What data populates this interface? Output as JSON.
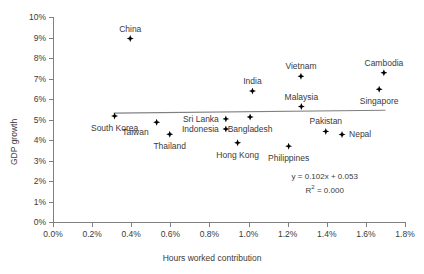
{
  "chart_data": {
    "type": "scatter",
    "title": "",
    "xlabel": "Hours worked contribution",
    "ylabel": "GDP growth",
    "xlim": [
      0.0,
      1.8
    ],
    "ylim": [
      0.0,
      10.0
    ],
    "xticks": [
      "0.0%",
      "0.2%",
      "0.4%",
      "0.6%",
      "0.8%",
      "1.0%",
      "1.2%",
      "1.4%",
      "1.6%",
      "1.8%"
    ],
    "xtick_values": [
      0.0,
      0.2,
      0.4,
      0.6,
      0.8,
      1.0,
      1.2,
      1.4,
      1.6,
      1.8
    ],
    "yticks": [
      "0%",
      "1%",
      "2%",
      "3%",
      "4%",
      "5%",
      "6%",
      "7%",
      "8%",
      "9%",
      "10%"
    ],
    "ytick_values": [
      0,
      1,
      2,
      3,
      4,
      5,
      6,
      7,
      8,
      9,
      10
    ],
    "grid": false,
    "legend": "none",
    "marker_color": "#000000",
    "axis_color": "#808080",
    "text_color": "#3a3a3a",
    "trendline": {
      "equation": "y = 0.102x + 0.053",
      "r_squared_label": "R",
      "r_squared_sup": "2",
      "r_squared_value": "= 0.000",
      "x_start": 0.31,
      "x_end": 1.7,
      "y_start": 5.31,
      "y_end": 5.45,
      "color": "#808080"
    },
    "points": [
      {
        "name": "China",
        "x": 0.395,
        "y": 8.95,
        "label_dx": 0,
        "label_dy": -9,
        "anchor": "center"
      },
      {
        "name": "South Korea",
        "x": 0.315,
        "y": 5.17,
        "label_dx": 0,
        "label_dy": 13,
        "anchor": "center"
      },
      {
        "name": "Taiwan",
        "x": 0.53,
        "y": 4.87,
        "label_dx": -8,
        "label_dy": 11,
        "anchor": "right"
      },
      {
        "name": "Thailand",
        "x": 0.597,
        "y": 4.28,
        "label_dx": 0,
        "label_dy": 13,
        "anchor": "center"
      },
      {
        "name": "Sri Lanka",
        "x": 0.884,
        "y": 5.03,
        "label_dx": -7,
        "label_dy": 1,
        "anchor": "right"
      },
      {
        "name": "Indonesia",
        "x": 0.884,
        "y": 4.54,
        "label_dx": -7,
        "label_dy": 1,
        "anchor": "right"
      },
      {
        "name": "Bangladesh",
        "x": 1.008,
        "y": 5.12,
        "label_dx": 0,
        "label_dy": 13,
        "anchor": "center"
      },
      {
        "name": "Hong Kong",
        "x": 0.944,
        "y": 3.87,
        "label_dx": 0,
        "label_dy": 13,
        "anchor": "center"
      },
      {
        "name": "India",
        "x": 1.02,
        "y": 6.39,
        "label_dx": 0,
        "label_dy": -9,
        "anchor": "center"
      },
      {
        "name": "Philippines",
        "x": 1.205,
        "y": 3.7,
        "label_dx": 0,
        "label_dy": 13,
        "anchor": "center"
      },
      {
        "name": "Vietnam",
        "x": 1.268,
        "y": 7.11,
        "label_dx": 0,
        "label_dy": -9,
        "anchor": "center"
      },
      {
        "name": "Malaysia",
        "x": 1.27,
        "y": 5.63,
        "label_dx": 0,
        "label_dy": -9,
        "anchor": "center"
      },
      {
        "name": "Pakistan",
        "x": 1.395,
        "y": 4.42,
        "label_dx": 0,
        "label_dy": -9,
        "anchor": "center"
      },
      {
        "name": "Nepal",
        "x": 1.478,
        "y": 4.27,
        "label_dx": 7,
        "label_dy": 1,
        "anchor": "left"
      },
      {
        "name": "Cambodia",
        "x": 1.692,
        "y": 7.28,
        "label_dx": 0,
        "label_dy": -9,
        "anchor": "center"
      },
      {
        "name": "Singapore",
        "x": 1.668,
        "y": 6.48,
        "label_dx": 0,
        "label_dy": 13,
        "anchor": "center"
      }
    ]
  }
}
